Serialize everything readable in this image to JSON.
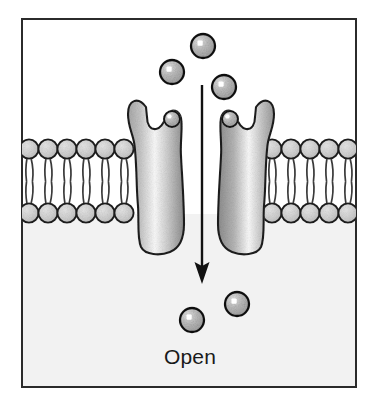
{
  "figure": {
    "title_label": "Open",
    "caption_text": "Open",
    "frame": {
      "x": 21,
      "y": 18,
      "width": 336,
      "height": 370,
      "border_color": "#2b2b2b",
      "border_width": 2,
      "fill_color": "#ffffff"
    },
    "regions": {
      "extracellular": {
        "name": "extracellular-space",
        "fill_color": "#ffffff",
        "y_top": 20,
        "y_bottom": 150
      },
      "cytoplasm": {
        "name": "intracellular-space",
        "fill_color": "#f2f2f2",
        "y_top": 214,
        "y_bottom": 386
      }
    },
    "membrane": {
      "name": "phospholipid-bilayer",
      "head_fill": "#d4d4d4",
      "head_stroke": "#1f1f1f",
      "tail_color": "#3a3a3a",
      "head_radius": 9.5,
      "outer_leaflet_y": 149,
      "inner_leaflet_y": 213,
      "left_segment": {
        "x_start": 23,
        "x_end": 135,
        "head_count": 6
      },
      "right_segment": {
        "x_start": 262,
        "x_end": 356,
        "head_count": 6
      }
    },
    "channel": {
      "name": "ion-channel-protein",
      "state": "open",
      "fill_light": "#ffffff",
      "fill_mid": "#c9c9c9",
      "fill_dark": "#8f8f8f",
      "stroke_color": "#1f1f1f",
      "pore_width": 22,
      "subunits": [
        {
          "name": "channel-subunit-left",
          "x": 132,
          "y": 96,
          "width": 58,
          "height": 160
        },
        {
          "name": "channel-subunit-right",
          "x": 214,
          "y": 96,
          "width": 60,
          "height": 160
        }
      ],
      "bound_ions": [
        {
          "name": "bound-ion-left",
          "cx": 173,
          "cy": 119,
          "r": 8
        },
        {
          "name": "bound-ion-right",
          "cx": 231,
          "cy": 119,
          "r": 8
        }
      ]
    },
    "flux_arrow": {
      "name": "ion-flux-arrow",
      "direction": "downward",
      "x": 202,
      "y_start": 85,
      "y_end": 282,
      "color": "#111111",
      "line_width": 2.4,
      "head_width": 11,
      "head_length": 17
    },
    "ions": {
      "fill_color": "#b8b8b8",
      "stroke_color": "#121212",
      "highlight_color": "#ffffff",
      "radius": 12,
      "above": [
        {
          "name": "ion-above-top",
          "cx": 203,
          "cy": 46,
          "r": 12
        },
        {
          "name": "ion-above-left",
          "cx": 172,
          "cy": 72,
          "r": 12
        },
        {
          "name": "ion-above-right",
          "cx": 224,
          "cy": 87,
          "r": 12
        }
      ],
      "below": [
        {
          "name": "ion-below-left",
          "cx": 192,
          "cy": 320,
          "r": 12
        },
        {
          "name": "ion-below-right",
          "cx": 237,
          "cy": 304,
          "r": 12
        }
      ]
    },
    "caption": {
      "name": "state-caption",
      "x": 190,
      "y": 364,
      "font_size": 21,
      "color": "#1a1a1a"
    }
  }
}
